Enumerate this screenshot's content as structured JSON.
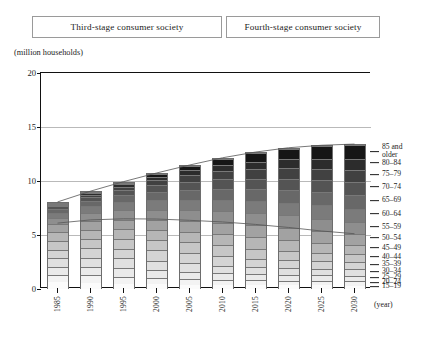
{
  "header": {
    "stages": [
      {
        "label": "Third-stage consumer society"
      },
      {
        "label": "Fourth-stage consumer society"
      }
    ]
  },
  "chart_data": {
    "type": "bar",
    "subtype": "stacked-bar",
    "title": "",
    "unit_caption": "(million households)",
    "xlabel": "(year)",
    "ylabel": "",
    "ylim": [
      0,
      20
    ],
    "yticks": [
      0,
      5,
      10,
      15,
      20
    ],
    "ytick_labels": [
      "0",
      "5",
      "10",
      "15",
      "20"
    ],
    "grid": true,
    "legend_position": "right",
    "categories": [
      "1985",
      "1990",
      "1995",
      "2000",
      "2005",
      "2010",
      "2015",
      "2020",
      "2025",
      "2030"
    ],
    "series": [
      {
        "name": "15-19",
        "color": "#fbfbfb",
        "values": [
          0.62,
          0.58,
          0.5,
          0.44,
          0.4,
          0.37,
          0.35,
          0.34,
          0.33,
          0.32
        ]
      },
      {
        "name": "20-24",
        "color": "#f3f3f3",
        "values": [
          0.7,
          0.72,
          0.66,
          0.58,
          0.52,
          0.48,
          0.45,
          0.44,
          0.42,
          0.41
        ]
      },
      {
        "name": "25-29",
        "color": "#eaeaea",
        "values": [
          0.76,
          0.8,
          0.82,
          0.74,
          0.66,
          0.6,
          0.56,
          0.54,
          0.52,
          0.51
        ]
      },
      {
        "name": "30-34",
        "color": "#e0e0e0",
        "values": [
          0.8,
          0.84,
          0.88,
          0.9,
          0.82,
          0.74,
          0.68,
          0.64,
          0.62,
          0.6
        ]
      },
      {
        "name": "35-39",
        "color": "#d4d4d4",
        "values": [
          0.82,
          0.86,
          0.9,
          0.94,
          0.96,
          0.88,
          0.8,
          0.74,
          0.7,
          0.68
        ]
      },
      {
        "name": "40-44",
        "color": "#c6c6c6",
        "values": [
          0.84,
          0.88,
          0.92,
          0.96,
          1.0,
          1.02,
          0.94,
          0.86,
          0.8,
          0.76
        ]
      },
      {
        "name": "45-49",
        "color": "#b6b6b6",
        "values": [
          0.82,
          0.88,
          0.92,
          0.96,
          1.0,
          1.06,
          1.08,
          1.0,
          0.92,
          0.86
        ]
      },
      {
        "name": "50-54",
        "color": "#a2a2a2",
        "values": [
          0.74,
          0.84,
          0.9,
          0.96,
          1.0,
          1.06,
          1.12,
          1.14,
          1.06,
          0.98
        ]
      },
      {
        "name": "55-59",
        "color": "#8e8e8e",
        "values": [
          0.62,
          0.76,
          0.86,
          0.94,
          1.0,
          1.06,
          1.12,
          1.18,
          1.2,
          1.12
        ]
      },
      {
        "name": "60-64",
        "color": "#7b7b7b",
        "values": [
          0.48,
          0.64,
          0.78,
          0.88,
          0.98,
          1.06,
          1.12,
          1.18,
          1.24,
          1.26
        ]
      },
      {
        "name": "65-69",
        "color": "#686868",
        "values": [
          0.34,
          0.48,
          0.64,
          0.78,
          0.9,
          1.0,
          1.08,
          1.14,
          1.2,
          1.26
        ]
      },
      {
        "name": "70-74",
        "color": "#545454",
        "values": [
          0.24,
          0.34,
          0.48,
          0.64,
          0.78,
          0.9,
          1.0,
          1.08,
          1.14,
          1.2
        ]
      },
      {
        "name": "75-79",
        "color": "#414141",
        "values": [
          0.14,
          0.22,
          0.32,
          0.46,
          0.62,
          0.76,
          0.88,
          0.98,
          1.06,
          1.12
        ]
      },
      {
        "name": "80-84",
        "color": "#2c2c2c",
        "values": [
          0.08,
          0.12,
          0.2,
          0.3,
          0.44,
          0.58,
          0.72,
          0.84,
          0.94,
          1.02
        ]
      },
      {
        "name": "85 and older",
        "color": "#161616",
        "values": [
          0.06,
          0.1,
          0.16,
          0.26,
          0.4,
          0.58,
          0.78,
          0.98,
          1.16,
          1.32
        ]
      }
    ],
    "totals": [
      7.86,
      9.06,
      10.94,
      12.74,
      14.48,
      15.95,
      16.68,
      17.08,
      17.31,
      17.42
    ],
    "legend_entries": [
      "85 and older",
      "80-84",
      "75-79",
      "70-74",
      "65-69",
      "60-64",
      "55-59",
      "50-54",
      "45-49",
      "40-44",
      "35-39",
      "30-34",
      "25-29",
      "20-24",
      "15-19"
    ]
  }
}
